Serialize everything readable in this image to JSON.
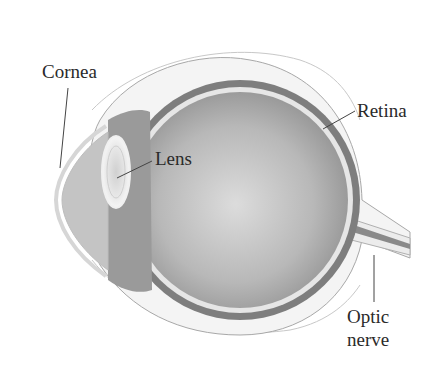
{
  "diagram": {
    "labels": {
      "cornea": "Cornea",
      "lens": "Lens",
      "retina": "Retina",
      "optic_nerve_line1": "Optic",
      "optic_nerve_line2": "nerve"
    },
    "colors": {
      "vitreous_center": "#d8d8d8",
      "vitreous_edge": "#8a8a8a",
      "choroid": "#7e7e7e",
      "retina_band": "#e6e6e6",
      "sclera": "#f4f4f4",
      "outline": "#9a9a9a",
      "text": "#2a2a2a"
    }
  }
}
